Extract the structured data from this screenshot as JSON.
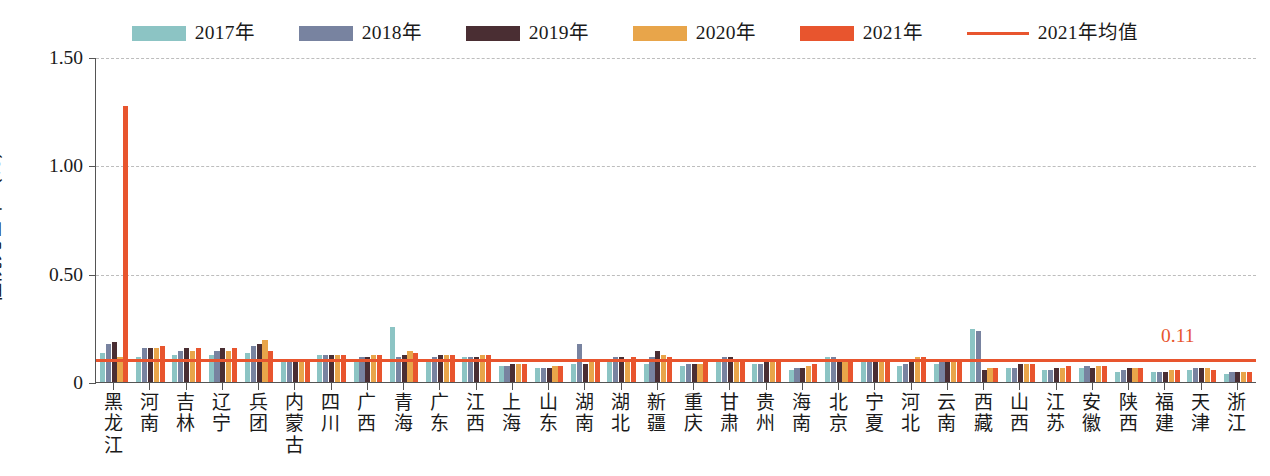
{
  "legend": {
    "items": [
      {
        "label": "2017年",
        "color": "#8CC4C4",
        "type": "swatch"
      },
      {
        "label": "2018年",
        "color": "#7883A0",
        "type": "swatch"
      },
      {
        "label": "2019年",
        "color": "#4A2E33",
        "type": "swatch"
      },
      {
        "label": "2020年",
        "color": "#E8A54A",
        "type": "swatch"
      },
      {
        "label": "2021年",
        "color": "#E8552E",
        "type": "swatch"
      },
      {
        "label": "2021年均值",
        "color": "#E8552E",
        "type": "line"
      }
    ]
  },
  "axes": {
    "y_title": "住院死亡率（%）",
    "y_ticks": [
      "1.50",
      "1.00",
      "0.50",
      "0"
    ],
    "y_min": 0,
    "y_max": 1.5
  },
  "mean_line": {
    "value": 0.11,
    "label": "0.11",
    "color": "#E8552E"
  },
  "chart_data": {
    "type": "bar",
    "title": "",
    "xlabel": "",
    "ylabel": "住院死亡率（%）",
    "ylim": [
      0,
      1.5
    ],
    "yticks": [
      0,
      0.5,
      1.0,
      1.5
    ],
    "grid": true,
    "legend_position": "top-center",
    "reference_line": {
      "name": "2021年均值",
      "value": 0.11,
      "label": "0.11"
    },
    "categories": [
      "黑龙江",
      "河南",
      "吉林",
      "辽宁",
      "兵团",
      "内蒙古",
      "四川",
      "广西",
      "青海",
      "广东",
      "江西",
      "上海",
      "山东",
      "湖南",
      "湖北",
      "新疆",
      "重庆",
      "甘肃",
      "贵州",
      "海南",
      "北京",
      "宁夏",
      "河北",
      "云南",
      "西藏",
      "山西",
      "江苏",
      "安徽",
      "陕西",
      "福建",
      "天津",
      "浙江"
    ],
    "series": [
      {
        "name": "2017年",
        "color": "#8CC4C4",
        "values": [
          0.14,
          0.12,
          0.13,
          0.13,
          0.14,
          0.11,
          0.13,
          0.11,
          0.26,
          0.1,
          0.12,
          0.08,
          0.07,
          0.09,
          0.11,
          0.09,
          0.08,
          0.1,
          0.09,
          0.06,
          0.12,
          0.11,
          0.08,
          0.09,
          0.25,
          0.07,
          0.06,
          0.07,
          0.05,
          0.05,
          0.06,
          0.04
        ]
      },
      {
        "name": "2018年",
        "color": "#7883A0",
        "values": [
          0.18,
          0.16,
          0.15,
          0.15,
          0.17,
          0.11,
          0.13,
          0.12,
          0.12,
          0.12,
          0.12,
          0.08,
          0.07,
          0.18,
          0.12,
          0.12,
          0.09,
          0.12,
          0.09,
          0.07,
          0.12,
          0.1,
          0.09,
          0.1,
          0.24,
          0.07,
          0.06,
          0.08,
          0.06,
          0.05,
          0.07,
          0.05
        ]
      },
      {
        "name": "2019年",
        "color": "#4A2E33",
        "values": [
          0.19,
          0.16,
          0.16,
          0.16,
          0.18,
          0.1,
          0.13,
          0.12,
          0.13,
          0.13,
          0.12,
          0.09,
          0.07,
          0.09,
          0.12,
          0.15,
          0.09,
          0.12,
          0.1,
          0.07,
          0.11,
          0.11,
          0.1,
          0.1,
          0.06,
          0.09,
          0.07,
          0.07,
          0.07,
          0.05,
          0.07,
          0.05
        ]
      },
      {
        "name": "2020年",
        "color": "#E8A54A",
        "values": [
          0.12,
          0.16,
          0.15,
          0.15,
          0.2,
          0.11,
          0.13,
          0.13,
          0.15,
          0.13,
          0.13,
          0.09,
          0.08,
          0.1,
          0.11,
          0.13,
          0.09,
          0.11,
          0.11,
          0.08,
          0.11,
          0.11,
          0.12,
          0.1,
          0.07,
          0.09,
          0.07,
          0.08,
          0.07,
          0.06,
          0.07,
          0.05
        ]
      },
      {
        "name": "2021年",
        "color": "#E8552E",
        "values": [
          1.28,
          0.17,
          0.16,
          0.16,
          0.15,
          0.11,
          0.13,
          0.13,
          0.14,
          0.13,
          0.13,
          0.09,
          0.08,
          0.1,
          0.12,
          0.12,
          0.1,
          0.11,
          0.11,
          0.09,
          0.11,
          0.11,
          0.12,
          0.11,
          0.07,
          0.09,
          0.08,
          0.08,
          0.07,
          0.06,
          0.06,
          0.05
        ]
      }
    ]
  }
}
